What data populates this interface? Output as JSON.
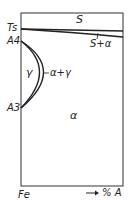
{
  "diagram": {
    "type": "phase-diagram",
    "axis": {
      "left_label": "Fe",
      "right_label": "% A",
      "arrow": "→"
    },
    "temperature_labels": {
      "ts": "Ts",
      "a4": "A4",
      "a3": "A3"
    },
    "regions": {
      "liquid": "S",
      "liquid_alpha": "S+α",
      "gamma": "γ",
      "alpha_gamma": "α+γ",
      "alpha": "α"
    },
    "colors": {
      "line": "#222222",
      "background": "#ffffff"
    }
  }
}
